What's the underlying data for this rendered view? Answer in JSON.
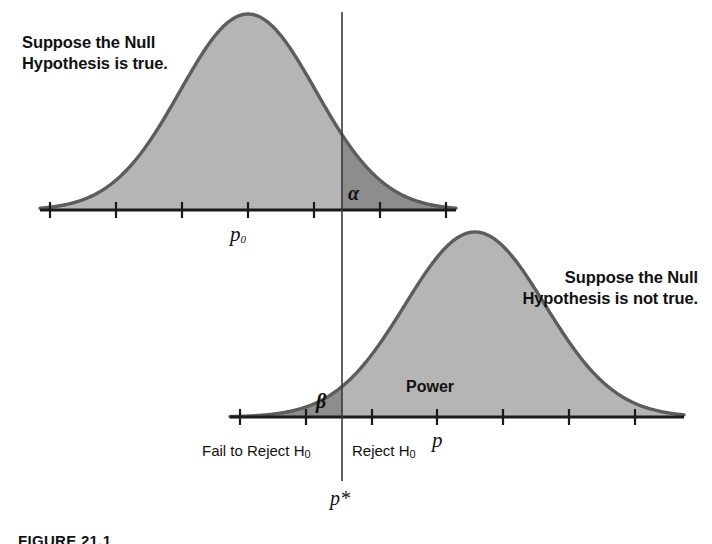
{
  "figure": {
    "caption": "FIGURE 21.1",
    "annotations": {
      "null_true": "Suppose the Null\nHypothesis is true.",
      "null_false": "Suppose the Null\nHypothesis is not true.",
      "power": "Power",
      "alpha": "α",
      "beta": "β",
      "p_null": "p",
      "p_null_sub": "0",
      "p_alt": "p",
      "p_critical": "p*",
      "fail_to_reject": "Fail to Reject H",
      "fail_to_reject_sub": "0",
      "reject": "Reject H",
      "reject_sub": "0"
    },
    "colors": {
      "curve_fill": "#b5b5b5",
      "region_fill": "#8d8d8d",
      "curve_stroke": "#5d5d5d",
      "axis": "#1a1a1a",
      "text": "#111111",
      "background": "#ffffff"
    }
  },
  "chart_data": {
    "type": "area",
    "title": "",
    "subtitle": "",
    "xlabel": "",
    "ylabel": "",
    "grid": false,
    "legend": "none",
    "axes": [
      {
        "name": "null-axis",
        "y_pixel": 210,
        "x_start": 40,
        "x_end": 456,
        "ticks": [
          50,
          116,
          182,
          248,
          314,
          380,
          446
        ],
        "tick_labels": [
          "",
          "",
          "",
          "p0",
          "",
          "",
          ""
        ]
      },
      {
        "name": "alternative-axis",
        "y_pixel": 417,
        "x_start": 230,
        "x_end": 684,
        "ticks": [
          240,
          306,
          372,
          437,
          503,
          569,
          635
        ],
        "tick_labels": [
          "",
          "",
          "",
          "",
          "p",
          "",
          ""
        ]
      }
    ],
    "series": [
      {
        "name": "Null distribution (H0 true)",
        "mean_pixel": 248,
        "sd_pixel": 68,
        "peak_y_pixel": 14,
        "baseline_y_pixel": 210,
        "center_label": "p0",
        "shaded_tail": {
          "label": "α",
          "side": "right",
          "from_pixel": 342,
          "meaning": "Type I error probability (significance level)"
        }
      },
      {
        "name": "Alternative distribution (H0 not true)",
        "mean_pixel": 475,
        "sd_pixel": 70,
        "peak_y_pixel": 232,
        "baseline_y_pixel": 417,
        "center_label": "p",
        "shaded_tail": {
          "label": "β",
          "side": "left",
          "to_pixel": 342,
          "meaning": "Type II error probability"
        },
        "shaded_main": {
          "label": "Power",
          "side": "right",
          "from_pixel": 342,
          "meaning": "1 minus beta"
        }
      }
    ],
    "critical_value": {
      "label": "p*",
      "x_pixel": 342,
      "line_top_pixel": 12,
      "line_bottom_pixel": 481,
      "left_region": "Fail to Reject H0",
      "right_region": "Reject H0"
    }
  }
}
